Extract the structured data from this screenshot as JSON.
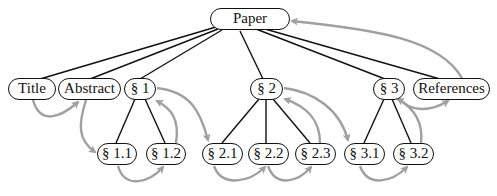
{
  "diagram": {
    "type": "tree-with-reading-order",
    "colors": {
      "node_border": "#111111",
      "tree_edge": "#111111",
      "order_arrow": "#a0a0a0",
      "background": "#ffffff"
    },
    "nodes": {
      "paper": {
        "label": "Paper"
      },
      "title": {
        "label": "Title"
      },
      "abstract": {
        "label": "Abstract"
      },
      "s1": {
        "label": "§ 1"
      },
      "s2": {
        "label": "§ 2"
      },
      "s3": {
        "label": "§ 3"
      },
      "references": {
        "label": "References"
      },
      "s1_1": {
        "label": "§ 1.1"
      },
      "s1_2": {
        "label": "§ 1.2"
      },
      "s2_1": {
        "label": "§ 2.1"
      },
      "s2_2": {
        "label": "§ 2.2"
      },
      "s2_3": {
        "label": "§ 2.3"
      },
      "s3_1": {
        "label": "§ 3.1"
      },
      "s3_2": {
        "label": "§ 3.2"
      }
    },
    "tree_edges": [
      [
        "Paper",
        "Title"
      ],
      [
        "Paper",
        "Abstract"
      ],
      [
        "Paper",
        "§ 1"
      ],
      [
        "Paper",
        "§ 2"
      ],
      [
        "Paper",
        "§ 3"
      ],
      [
        "Paper",
        "References"
      ],
      [
        "§ 1",
        "§ 1.1"
      ],
      [
        "§ 1",
        "§ 1.2"
      ],
      [
        "§ 2",
        "§ 2.1"
      ],
      [
        "§ 2",
        "§ 2.2"
      ],
      [
        "§ 2",
        "§ 2.3"
      ],
      [
        "§ 3",
        "§ 3.1"
      ],
      [
        "§ 3",
        "§ 3.2"
      ]
    ],
    "order_arrows": [
      [
        "Title",
        "Abstract"
      ],
      [
        "Abstract",
        "§ 1.1"
      ],
      [
        "§ 1.1",
        "§ 1.2"
      ],
      [
        "§ 1.2",
        "§ 1"
      ],
      [
        "§ 1",
        "§ 2.1"
      ],
      [
        "§ 2.1",
        "§ 2.2"
      ],
      [
        "§ 2.2",
        "§ 2.3"
      ],
      [
        "§ 2.3",
        "§ 2"
      ],
      [
        "§ 2",
        "§ 3.1"
      ],
      [
        "§ 3.1",
        "§ 3.2"
      ],
      [
        "§ 3.2",
        "§ 3"
      ],
      [
        "§ 3",
        "References"
      ],
      [
        "References",
        "Paper"
      ]
    ]
  }
}
